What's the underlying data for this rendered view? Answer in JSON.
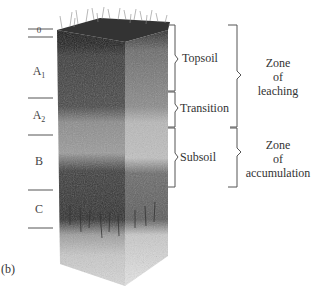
{
  "figure": {
    "panel_label": "(b)"
  },
  "horizons": [
    {
      "id": "O",
      "label": "0",
      "sub": ""
    },
    {
      "id": "A1",
      "label": "A",
      "sub": "1"
    },
    {
      "id": "A2",
      "label": "A",
      "sub": "2"
    },
    {
      "id": "B",
      "label": "B",
      "sub": ""
    },
    {
      "id": "C",
      "label": "C",
      "sub": ""
    }
  ],
  "layers": [
    {
      "label": "Topsoil"
    },
    {
      "label": "Transition"
    },
    {
      "label": "Subsoil"
    }
  ],
  "zones": [
    {
      "line1": "Zone",
      "line2": "of",
      "line3": "leaching"
    },
    {
      "line1": "Zone",
      "line2": "of",
      "line3": "accumulation"
    }
  ],
  "colors": {
    "line": "#555555",
    "text": "#333333",
    "background": "#ffffff"
  }
}
